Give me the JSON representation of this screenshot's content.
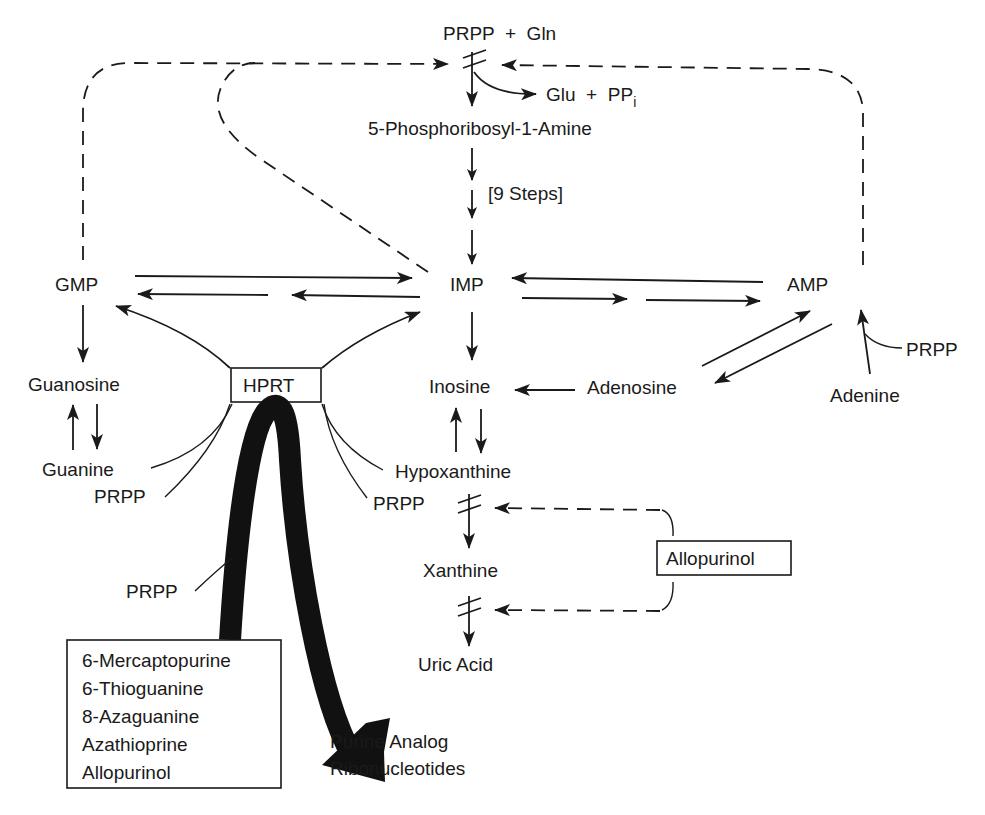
{
  "diagram": {
    "nodes": {
      "prpp_gln": "PRPP  +  Gln",
      "glu_ppi": "Glu  +  PP",
      "glu_ppi_sub": "i",
      "phosphoribosyl_amine": "5-Phosphoribosyl-1-Amine",
      "nine_steps": "[9 Steps]",
      "gmp": "GMP",
      "imp": "IMP",
      "amp": "AMP",
      "guanosine": "Guanosine",
      "guanine": "Guanine",
      "hprt": "HPRT",
      "inosine": "Inosine",
      "adenosine": "Adenosine",
      "adenine": "Adenine",
      "prpp_adenine": "PRPP",
      "hypoxanthine": "Hypoxanthine",
      "prpp_guanine": "PRPP",
      "prpp_hypoxanthine": "PRPP",
      "prpp_analogs": "PRPP",
      "xanthine": "Xanthine",
      "uric_acid": "Uric Acid",
      "allopurinol_inhibitor": "Allopurinol",
      "purine_analog_line1": "Purine Analog",
      "purine_analog_line2": "Ribonucleotides"
    },
    "drug_list": [
      "6-Mercaptopurine",
      "6-Thioguanine",
      "8-Azaguanine",
      "Azathioprine",
      "Allopurinol"
    ],
    "colors": {
      "ink": "#1a1a1a",
      "background": "#ffffff"
    }
  }
}
